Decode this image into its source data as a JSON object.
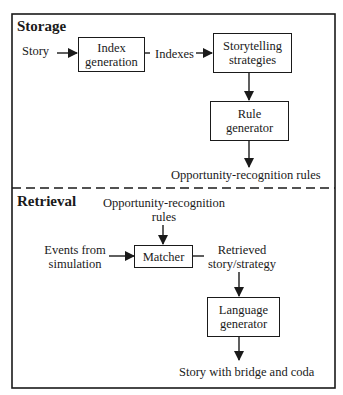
{
  "storage": {
    "heading": "Storage",
    "input_label": "Story",
    "index_box": {
      "line1": "Index",
      "line2": "generation"
    },
    "indexes_label": "Indexes",
    "strategies_box": {
      "line1": "Storytelling",
      "line2": "strategies"
    },
    "rule_box": {
      "line1": "Rule",
      "line2": "generator"
    },
    "output_label": "Opportunity-recognition rules"
  },
  "retrieval": {
    "heading": "Retrieval",
    "rules_label": {
      "line1": "Opportunity-recognition",
      "line2": "rules"
    },
    "events_label": {
      "line1": "Events from",
      "line2": "simulation"
    },
    "matcher_box": "Matcher",
    "retrieved_label": {
      "line1": "Retrieved",
      "line2": "story/strategy"
    },
    "language_box": {
      "line1": "Language",
      "line2": "generator"
    },
    "output_label": "Story with bridge and coda"
  }
}
